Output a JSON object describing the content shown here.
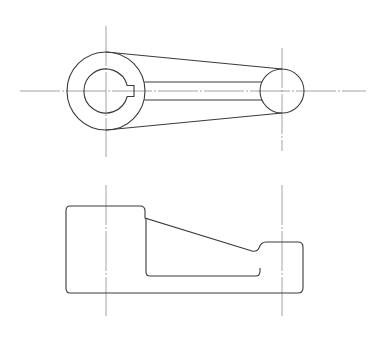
{
  "drawing": {
    "title": "",
    "type": "orthographic-projection",
    "views": [
      {
        "name": "top-view",
        "description": "crank arm plan with keyed hub and boss"
      },
      {
        "name": "front-view",
        "description": "crank arm elevation with stepped profile"
      }
    ],
    "colors": {
      "background": "#ffffff",
      "object_line": "#3a3a3a",
      "center_line": "#8a8a8a"
    }
  }
}
